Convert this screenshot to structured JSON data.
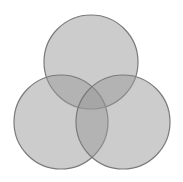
{
  "diagram": {
    "type": "venn",
    "set_count": 3,
    "background": "#ffffff",
    "fill_color": "#9a9a9a",
    "fill_opacity": 0.5,
    "stroke_color": "#7a7a7a",
    "circles": [
      {
        "id": "top",
        "cx": 91,
        "cy": 62,
        "r": 47,
        "label": ""
      },
      {
        "id": "left",
        "cx": 61,
        "cy": 122,
        "r": 47,
        "label": ""
      },
      {
        "id": "right",
        "cx": 123,
        "cy": 122,
        "r": 47,
        "label": ""
      }
    ]
  }
}
